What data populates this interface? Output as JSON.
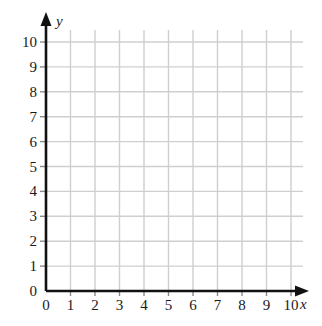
{
  "chart_data": {
    "type": "scatter",
    "title": "",
    "subtitle": "",
    "xlabel": "x",
    "ylabel": "y",
    "xlim": [
      0,
      10
    ],
    "ylim": [
      0,
      10
    ],
    "x_ticks": [
      "0",
      "1",
      "2",
      "3",
      "4",
      "5",
      "6",
      "7",
      "8",
      "9",
      "10"
    ],
    "y_ticks": [
      "0",
      "1",
      "2",
      "3",
      "4",
      "5",
      "6",
      "7",
      "8",
      "9",
      "10"
    ],
    "grid": true,
    "legend": "none",
    "series": [],
    "annotations": []
  },
  "axes": {
    "x_label": "x",
    "y_label": "y",
    "origin_label": "0"
  },
  "colors": {
    "background": "#ffffff",
    "grid": "#cfcfcf",
    "axis": "#111111",
    "label": "#1a1a1a"
  }
}
